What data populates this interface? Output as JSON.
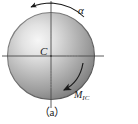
{
  "figure": {
    "caption": "（a）",
    "center_label": "C",
    "angular_acceleration_label": "α",
    "inertia_couple_label": "M",
    "inertia_couple_subscript": "IC",
    "colors": {
      "sphere_highlight": "#f2f2f2",
      "sphere_mid": "#a8a8a8",
      "sphere_edge": "#5e5e5e",
      "axis_line": "#4a4a4a",
      "arrow": "#1a1a1a",
      "background": "#ffffff"
    },
    "geometry": {
      "sphere_center_x": 51,
      "sphere_center_y": 56,
      "sphere_radius": 44,
      "horizontal_axis_x1": 2,
      "horizontal_axis_x2": 104,
      "vertical_axis_y1": 1,
      "vertical_axis_y2": 108
    },
    "arrows": {
      "outer_arc_direction": "counterclockwise",
      "inner_arc_direction": "counterclockwise"
    }
  }
}
